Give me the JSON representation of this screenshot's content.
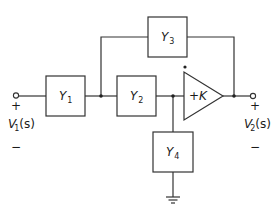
{
  "diagram": {
    "type": "circuit-block-diagram",
    "blocks": {
      "y1": {
        "name": "Y",
        "sub": "1"
      },
      "y2": {
        "name": "Y",
        "sub": "2"
      },
      "y3": {
        "name": "Y",
        "sub": "3"
      },
      "y4": {
        "name": "Y",
        "sub": "4"
      }
    },
    "amplifier": {
      "label": "+K"
    },
    "input": {
      "plus": "+",
      "minus": "−",
      "name": "V",
      "sub": "1",
      "arg": "(s)"
    },
    "output": {
      "plus": "+",
      "minus": "−",
      "name": "V",
      "sub": "2",
      "arg": "(s)"
    },
    "ground_symbol": "ground-icon"
  }
}
